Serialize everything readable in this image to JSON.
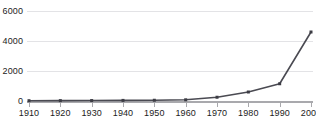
{
  "chart_data": {
    "type": "line",
    "title": "",
    "subtitle": "",
    "xlabel": "",
    "ylabel": "",
    "x": [
      1910,
      1920,
      1930,
      1940,
      1950,
      1960,
      1970,
      1980,
      1990,
      2000
    ],
    "categories": [
      "1910",
      "1920",
      "1930",
      "1940",
      "1950",
      "1960",
      "1970",
      "1980",
      "1990",
      "2000"
    ],
    "values": [
      20,
      25,
      30,
      40,
      50,
      80,
      250,
      600,
      1150,
      4600
    ],
    "series": [
      {
        "name": "",
        "values": [
          20,
          25,
          30,
          40,
          50,
          80,
          250,
          600,
          1150,
          4600
        ]
      }
    ],
    "ylim": [
      0,
      6000
    ],
    "xlim": [
      1910,
      2000
    ],
    "y_ticks": [
      0,
      2000,
      4000,
      6000
    ],
    "y_tick_labels": [
      "0",
      "2000",
      "4000",
      "6000"
    ],
    "x_ticks": [
      1910,
      1920,
      1930,
      1940,
      1950,
      1960,
      1970,
      1980,
      1990,
      2000
    ],
    "x_tick_labels": [
      "1910",
      "1920",
      "1930",
      "1940",
      "1950",
      "1960",
      "1970",
      "1980",
      "1990",
      "2000"
    ],
    "grid": true,
    "grid_axis": "y",
    "legend": false,
    "legend_position": "none",
    "annotations": [],
    "marker": "square",
    "line_color": "#4a4a52",
    "marker_color": "#3c3c44",
    "grid_color": "#e3e3e6",
    "axis_color": "#a9a9ad",
    "background_color": "#ffffff",
    "text_color": "#1c1c1c"
  },
  "caption": {
    "text": ""
  }
}
